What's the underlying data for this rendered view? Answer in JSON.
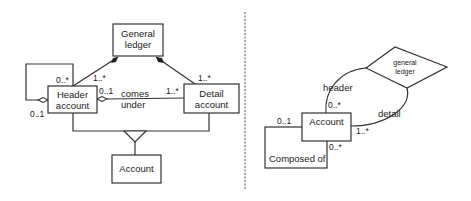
{
  "left_diagram": {
    "classes": {
      "general_ledger": [
        "General",
        "ledger"
      ],
      "header_account": [
        "Header",
        "account"
      ],
      "detail_account": [
        "Detail",
        "account"
      ],
      "account": [
        "Account"
      ]
    },
    "multiplicities": {
      "header_self_top": "0..*",
      "header_self_bottom": "0..1",
      "header_to_ledger": "1..*",
      "detail_to_ledger": "1..*",
      "header_comes_under": "0..1",
      "detail_comes_under": "1..*"
    },
    "association_label": [
      "comes",
      "under"
    ]
  },
  "right_diagram": {
    "entity_account": "Account",
    "relationship_ledger": [
      "general",
      "ledger"
    ],
    "relationship_composed": "Composed of",
    "roles": {
      "header": "header",
      "detail": "detail"
    },
    "multiplicities": {
      "header": "0..*",
      "detail": "1..*",
      "composed_top": "0..1",
      "composed_bottom": "0..*"
    }
  }
}
